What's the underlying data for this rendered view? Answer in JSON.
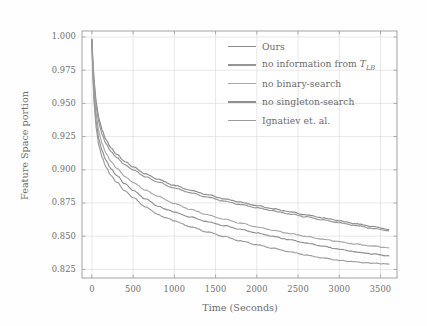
{
  "chart_data": {
    "type": "line",
    "title": "",
    "xlabel": "Time (Seconds)",
    "ylabel": "Feature Space portion",
    "xlim": [
      -120,
      3700
    ],
    "ylim": [
      0.8185,
      1.0045
    ],
    "xticks": [
      0,
      500,
      1000,
      1500,
      2000,
      2500,
      3000,
      3500
    ],
    "xtick_labels": [
      "0",
      "500",
      "1000",
      "1500",
      "2000",
      "2500",
      "3000",
      "3500"
    ],
    "yticks": [
      0.825,
      0.85,
      0.875,
      0.9,
      0.925,
      0.95,
      0.975,
      1.0
    ],
    "ytick_labels": [
      "0.825",
      "0.850",
      "0.875",
      "0.900",
      "0.925",
      "0.950",
      "0.975",
      "1.000"
    ],
    "grid": true,
    "legend_position": "upper right",
    "legend": [
      {
        "label": "Ours",
        "color": "#8c8c8c"
      },
      {
        "label": "no information from T",
        "sub": "LB",
        "color": "#949494"
      },
      {
        "label": "no binary-search",
        "color": "#a8a8a8"
      },
      {
        "label": "no singleton-search",
        "color": "#8f8f8f"
      },
      {
        "label": "Ignatiev et. al.",
        "color": "#9b9b9b"
      }
    ],
    "series": [
      {
        "name": "Ours",
        "color": "#8c8c8c",
        "x": [
          0,
          10,
          25,
          50,
          80,
          120,
          170,
          230,
          300,
          400,
          500,
          650,
          800,
          1000,
          1200,
          1400,
          1600,
          1800,
          2000,
          2200,
          2400,
          2600,
          2800,
          3000,
          3200,
          3400,
          3600
        ],
        "y": [
          0.9985,
          0.984,
          0.969,
          0.952,
          0.94,
          0.9305,
          0.9228,
          0.9165,
          0.9118,
          0.9062,
          0.902,
          0.8968,
          0.8928,
          0.8882,
          0.8845,
          0.8812,
          0.8782,
          0.8756,
          0.873,
          0.8706,
          0.8683,
          0.866,
          0.8638,
          0.8616,
          0.8594,
          0.8572,
          0.855
        ]
      },
      {
        "name": "no information from T_LB",
        "color": "#949494",
        "x": [
          0,
          10,
          25,
          50,
          80,
          120,
          170,
          230,
          300,
          400,
          500,
          650,
          800,
          1000,
          1200,
          1400,
          1600,
          1800,
          2000,
          2200,
          2400,
          2600,
          2800,
          3000,
          3200,
          3400,
          3600
        ],
        "y": [
          0.9982,
          0.9825,
          0.9665,
          0.949,
          0.9368,
          0.9272,
          0.9198,
          0.9138,
          0.9092,
          0.9038,
          0.8998,
          0.8948,
          0.8908,
          0.8862,
          0.8826,
          0.8794,
          0.8765,
          0.8739,
          0.8714,
          0.869,
          0.8667,
          0.8645,
          0.8623,
          0.8601,
          0.858,
          0.8559,
          0.854
        ]
      },
      {
        "name": "no binary-search",
        "color": "#a8a8a8",
        "x": [
          0,
          10,
          25,
          50,
          80,
          120,
          170,
          230,
          300,
          400,
          500,
          650,
          800,
          1000,
          1200,
          1400,
          1600,
          1800,
          2000,
          2200,
          2400,
          2600,
          2800,
          3000,
          3200,
          3400,
          3600
        ],
        "y": [
          0.9978,
          0.98,
          0.9615,
          0.9428,
          0.93,
          0.9202,
          0.9126,
          0.9062,
          0.9012,
          0.895,
          0.8904,
          0.8846,
          0.88,
          0.8745,
          0.87,
          0.8662,
          0.8628,
          0.8598,
          0.857,
          0.8544,
          0.852,
          0.8498,
          0.8477,
          0.8458,
          0.844,
          0.8425,
          0.8412
        ]
      },
      {
        "name": "no singleton-search",
        "color": "#8f8f8f",
        "x": [
          0,
          10,
          25,
          50,
          80,
          120,
          170,
          230,
          300,
          400,
          500,
          650,
          800,
          900,
          1000,
          1200,
          1400,
          1600,
          1800,
          2000,
          2200,
          2400,
          2600,
          2800,
          3000,
          3200,
          3400,
          3600
        ],
        "y": [
          0.9975,
          0.9765,
          0.956,
          0.937,
          0.9242,
          0.9148,
          0.9072,
          0.9008,
          0.8958,
          0.8894,
          0.8846,
          0.878,
          0.8728,
          0.8702,
          0.8682,
          0.8644,
          0.861,
          0.858,
          0.8552,
          0.8524,
          0.8498,
          0.8472,
          0.8448,
          0.8424,
          0.8402,
          0.8382,
          0.8366,
          0.8352
        ]
      },
      {
        "name": "Ignatiev et. al.",
        "color": "#9b9b9b",
        "x": [
          0,
          10,
          25,
          50,
          80,
          120,
          170,
          230,
          300,
          400,
          500,
          650,
          800,
          900,
          1000,
          1200,
          1400,
          1600,
          1800,
          2000,
          2200,
          2400,
          2600,
          2800,
          3000,
          3200,
          3400,
          3600
        ],
        "y": [
          0.997,
          0.9735,
          0.952,
          0.9325,
          0.9196,
          0.91,
          0.9022,
          0.8958,
          0.8906,
          0.884,
          0.879,
          0.872,
          0.8664,
          0.8638,
          0.8614,
          0.857,
          0.8532,
          0.8498,
          0.8466,
          0.8436,
          0.8408,
          0.8382,
          0.8358,
          0.8336,
          0.8318,
          0.8305,
          0.8296,
          0.829
        ]
      }
    ]
  },
  "figure": {
    "background": "#fefefe",
    "axis_color": "#9a9a9a",
    "grid_color": "#d6d6d6",
    "text_color": "#6b6b6b"
  }
}
